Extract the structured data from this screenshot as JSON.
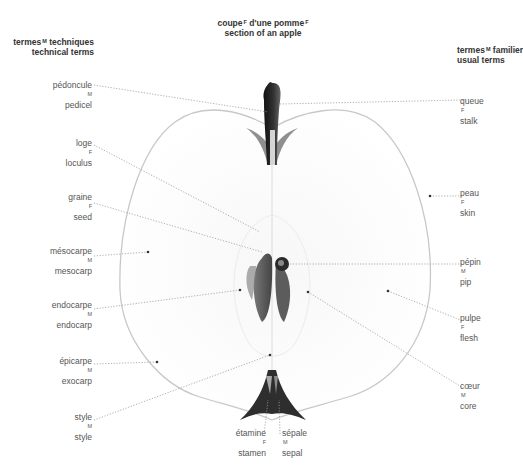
{
  "title": {
    "fr": "coupe",
    "fr_sup": "F",
    "fr2": " d'une pomme",
    "fr2_sup": "F",
    "en": "section of an apple"
  },
  "headers": {
    "left": {
      "fr": "termes",
      "fr_sup": "M",
      "fr_rest": " techniques",
      "en": "technical terms"
    },
    "right": {
      "fr": "termes",
      "fr_sup": "M",
      "fr_rest": " familiers",
      "en": "usual terms"
    }
  },
  "labels_left": [
    {
      "id": "pedicel",
      "fr": "pédoncule",
      "sup": "M",
      "en": "pedicel"
    },
    {
      "id": "loculus",
      "fr": "loge",
      "sup": "F",
      "en": "loculus"
    },
    {
      "id": "seed",
      "fr": "graine",
      "sup": "F",
      "en": "seed"
    },
    {
      "id": "mesocarp",
      "fr": "mésocarpe",
      "sup": "M",
      "en": "mesocarp"
    },
    {
      "id": "endocarp",
      "fr": "endocarpe",
      "sup": "M",
      "en": "endocarp"
    },
    {
      "id": "exocarp",
      "fr": "épicarpe",
      "sup": "M",
      "en": "exocarp"
    },
    {
      "id": "style",
      "fr": "style",
      "sup": "M",
      "en": "style"
    }
  ],
  "labels_bottom": [
    {
      "id": "stamen",
      "fr": "étamine",
      "sup": "F",
      "en": "stamen"
    },
    {
      "id": "sepal",
      "fr": "sépale",
      "sup": "M",
      "en": "sepal"
    }
  ],
  "labels_right": [
    {
      "id": "stalk",
      "fr": "queue",
      "sup": "F",
      "en": "stalk"
    },
    {
      "id": "skin",
      "fr": "peau",
      "sup": "F",
      "en": "skin"
    },
    {
      "id": "pip",
      "fr": "pépin",
      "sup": "M",
      "en": "pip"
    },
    {
      "id": "flesh",
      "fr": "pulpe",
      "sup": "F",
      "en": "flesh"
    },
    {
      "id": "core",
      "fr": "cœur",
      "sup": "M",
      "en": "core"
    }
  ],
  "colors": {
    "outline": "#c8c8c8",
    "leader": "#9a9a9a",
    "stalk": "#1a1a1a",
    "seed": "#5a5a5a",
    "calyx": "#2e2e2e"
  }
}
